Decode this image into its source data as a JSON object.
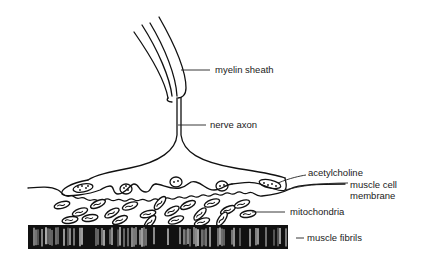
{
  "diagram": {
    "ink_color": "#111111",
    "background": "#ffffff",
    "labels": {
      "myelin_sheath": "myelin sheath",
      "nerve_axon": "nerve axon",
      "acetylcholine": "acetylcholine",
      "muscle_cell_membrane_line1": "muscle cell",
      "muscle_cell_membrane_line2": "membrane",
      "mitochondria": "mitochondria",
      "muscle_fibrils": "muscle fibrils"
    }
  }
}
